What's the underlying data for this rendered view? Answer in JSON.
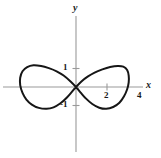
{
  "figure": {
    "title": "",
    "background_color": "#ffffff",
    "curve_color": "#161616",
    "axis_color": "#9a9a9a",
    "text_color": "#1a1a1a"
  },
  "axes": {
    "x_axis_label": "x",
    "y_axis_label": "y",
    "origin_px": {
      "x": 76,
      "y": 87
    },
    "x_unit_px": 15.5,
    "y_unit_px": 18.5
  },
  "ticks": {
    "x": [
      {
        "label": "2",
        "value": 2
      },
      {
        "label": "4",
        "value": 4
      }
    ],
    "y": [
      {
        "label": "1",
        "value": 1
      },
      {
        "label": "-1",
        "value": -1
      }
    ]
  },
  "chart_data": {
    "type": "line",
    "title": "",
    "xlabel": "x",
    "ylabel": "y",
    "grid": false,
    "legend": null,
    "xlim": [
      -4.9,
      5.5
    ],
    "ylim": [
      -3.8,
      3.8
    ],
    "xticks": [
      2,
      4
    ],
    "xticklabels": [
      "2",
      "4"
    ],
    "yticks": [
      1,
      -1
    ],
    "yticklabels": [
      "1",
      "-1"
    ],
    "series": [
      {
        "name": "lemniscate",
        "description": "figure-eight (lemniscate) curve centered at the origin, self-intersecting at (0, 0)",
        "equation": "(x^2 + y^2)^2 = a^2 (x^2 - y^2)",
        "x_extent": [
          -3.6,
          3.4
        ],
        "y_extent": [
          -1.2,
          1.2
        ],
        "points": [
          [
            0,
            0
          ],
          [
            0.35,
            0.3
          ],
          [
            0.75,
            0.56
          ],
          [
            1.2,
            0.78
          ],
          [
            1.7,
            0.95
          ],
          [
            2.2,
            1.08
          ],
          [
            2.7,
            1.14
          ],
          [
            3.05,
            1.1
          ],
          [
            3.3,
            0.92
          ],
          [
            3.4,
            0.62
          ],
          [
            3.4,
            0.25
          ],
          [
            3.3,
            -0.12
          ],
          [
            3.1,
            -0.5
          ],
          [
            2.8,
            -0.85
          ],
          [
            2.4,
            -1.08
          ],
          [
            1.95,
            -1.18
          ],
          [
            1.5,
            -1.12
          ],
          [
            1.05,
            -0.92
          ],
          [
            0.65,
            -0.63
          ],
          [
            0.3,
            -0.3
          ],
          [
            0,
            0
          ],
          [
            -0.35,
            0.3
          ],
          [
            -0.8,
            0.62
          ],
          [
            -1.25,
            0.85
          ],
          [
            -1.75,
            1.02
          ],
          [
            -2.25,
            1.14
          ],
          [
            -2.75,
            1.18
          ],
          [
            -3.15,
            1.08
          ],
          [
            -3.45,
            0.85
          ],
          [
            -3.6,
            0.5
          ],
          [
            -3.6,
            0.1
          ],
          [
            -3.45,
            -0.32
          ],
          [
            -3.2,
            -0.68
          ],
          [
            -2.85,
            -0.95
          ],
          [
            -2.4,
            -1.13
          ],
          [
            -1.9,
            -1.18
          ],
          [
            -1.45,
            -1.1
          ],
          [
            -1.0,
            -0.88
          ],
          [
            -0.6,
            -0.58
          ],
          [
            -0.28,
            -0.28
          ],
          [
            0,
            0
          ]
        ]
      }
    ]
  }
}
